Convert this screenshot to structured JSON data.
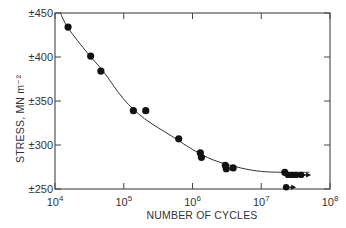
{
  "chart_data": {
    "type": "scatter",
    "title": "",
    "xlabel": "NUMBER OF CYCLES",
    "ylabel": "STRESS, MN m⁻²",
    "xscale": "log",
    "xlim": [
      10000,
      100000000
    ],
    "ylim": [
      250,
      450
    ],
    "grid": false,
    "legend": null,
    "x_ticks": [
      {
        "value": 10000,
        "label_base": "10",
        "label_exp": "4"
      },
      {
        "value": 100000,
        "label_base": "10",
        "label_exp": "5"
      },
      {
        "value": 1000000,
        "label_base": "10",
        "label_exp": "6"
      },
      {
        "value": 10000000,
        "label_base": "10",
        "label_exp": "7"
      },
      {
        "value": 100000000,
        "label_base": "10",
        "label_exp": "8"
      }
    ],
    "y_ticks": [
      {
        "value": 450,
        "label": "±450"
      },
      {
        "value": 400,
        "label": "±400"
      },
      {
        "value": 350,
        "label": "±350"
      },
      {
        "value": 300,
        "label": "±300"
      },
      {
        "value": 250,
        "label": "±250"
      }
    ],
    "series": [
      {
        "name": "failures",
        "marker": "filled-circle",
        "points": [
          {
            "x": 15500,
            "y": 434
          },
          {
            "x": 33000,
            "y": 401
          },
          {
            "x": 46500,
            "y": 384
          },
          {
            "x": 138000,
            "y": 339
          },
          {
            "x": 209000,
            "y": 339
          },
          {
            "x": 630000,
            "y": 307
          },
          {
            "x": 1300000,
            "y": 291
          },
          {
            "x": 1350000,
            "y": 286
          },
          {
            "x": 3000000,
            "y": 277
          },
          {
            "x": 3100000,
            "y": 273
          },
          {
            "x": 3900000,
            "y": 274
          },
          {
            "x": 22000000,
            "y": 269
          }
        ]
      },
      {
        "name": "runouts (unbroken)",
        "marker": "circle-with-arrow",
        "points": [
          {
            "x": 24000,
            "y": 0
          },
          {
            "x": 24500000,
            "y": 266
          },
          {
            "x": 28000000,
            "y": 266
          },
          {
            "x": 32000000,
            "y": 266
          },
          {
            "x": 38000000,
            "y": 266
          },
          {
            "x": 23000000,
            "y": 252
          }
        ]
      },
      {
        "name": "fitted S-N curve",
        "type": "line",
        "points": [
          {
            "x": 12000,
            "y": 450
          },
          {
            "x": 15500,
            "y": 433
          },
          {
            "x": 30000,
            "y": 404
          },
          {
            "x": 50000,
            "y": 384
          },
          {
            "x": 100000,
            "y": 352
          },
          {
            "x": 200000,
            "y": 330
          },
          {
            "x": 500000,
            "y": 310
          },
          {
            "x": 1000000,
            "y": 295
          },
          {
            "x": 2000000,
            "y": 283
          },
          {
            "x": 5000000,
            "y": 274
          },
          {
            "x": 10000000,
            "y": 270
          },
          {
            "x": 20000000,
            "y": 269
          },
          {
            "x": 50000000,
            "y": 269
          }
        ]
      }
    ]
  }
}
